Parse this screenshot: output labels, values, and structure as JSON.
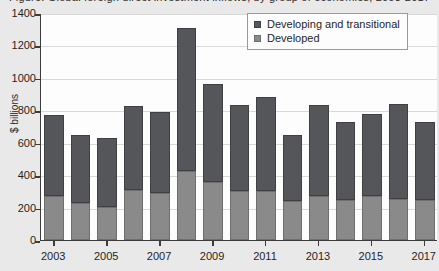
{
  "chart_data": {
    "type": "bar",
    "subtype": "stacked",
    "title": "Figure: Global foreign direct investment inflows, by group of economies, 2003-2017",
    "xlabel": "",
    "ylabel": "$ billions",
    "ylim": [
      0,
      1400
    ],
    "ytick_step": 200,
    "yticks": [
      0,
      200,
      400,
      600,
      800,
      1000,
      1200,
      1400
    ],
    "ytick_labels": [
      "0",
      "200",
      "400",
      "600",
      "800",
      "1000",
      "1200",
      "1400"
    ],
    "grid": true,
    "legend_position": "top-right",
    "categories": [
      2003,
      2004,
      2005,
      2006,
      2007,
      2008,
      2009,
      2010,
      2011,
      2012,
      2013,
      2014,
      2015,
      2016,
      2017
    ],
    "xtick_labels": [
      "2003",
      "2005",
      "2007",
      "2009",
      "2011",
      "2013",
      "2015",
      "2017"
    ],
    "series": [
      {
        "name": "Developed",
        "color": "#8a8a8a",
        "values": [
          270,
          230,
          205,
          310,
          290,
          425,
          360,
          300,
          305,
          240,
          270,
          245,
          270,
          255,
          245
        ]
      },
      {
        "name": "Developing and transitional",
        "color": "#55565a",
        "values": [
          500,
          420,
          425,
          515,
          500,
          885,
          600,
          535,
          575,
          405,
          560,
          485,
          505,
          585,
          480
        ]
      }
    ],
    "totals": [
      770,
      650,
      630,
      825,
      790,
      1310,
      960,
      835,
      880,
      645,
      830,
      730,
      775,
      840,
      725
    ]
  },
  "legend": {
    "entries": [
      {
        "label": "Developing and transitional",
        "swatch": "dark"
      },
      {
        "label": "Developed",
        "swatch": "light"
      }
    ]
  }
}
